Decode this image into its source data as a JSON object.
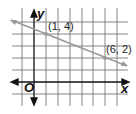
{
  "graph": {
    "axes": {
      "x_label": "x",
      "y_label": "y",
      "origin_label": "O"
    },
    "points": [
      {
        "label": "(1, 4)",
        "x": 1,
        "y": 4
      },
      {
        "label": "(6, 2)",
        "x": 6,
        "y": 2
      }
    ],
    "line": {
      "color": "#9a9a9a",
      "through": [
        "(1, 4)",
        "(6, 2)"
      ]
    },
    "grid": {
      "x_range": [
        -6,
        7
      ],
      "y_range": [
        -2,
        5
      ],
      "color": "#555555"
    }
  }
}
